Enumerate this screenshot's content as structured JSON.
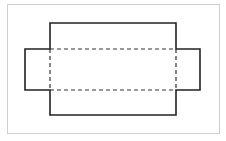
{
  "diagram": {
    "type": "net",
    "colors": {
      "frame": "#cfcfcf",
      "outline": "#222222",
      "fold": "#333333",
      "background": "#ffffff"
    },
    "outline_points": [
      [
        50,
        23
      ],
      [
        176,
        23
      ],
      [
        176,
        49
      ],
      [
        200,
        49
      ],
      [
        200,
        90
      ],
      [
        176,
        90
      ],
      [
        176,
        115
      ],
      [
        50,
        115
      ],
      [
        50,
        90
      ],
      [
        25,
        90
      ],
      [
        25,
        49
      ],
      [
        50,
        49
      ]
    ],
    "fold_lines": [
      {
        "x1": 50,
        "y1": 49,
        "x2": 176,
        "y2": 49
      },
      {
        "x1": 50,
        "y1": 90,
        "x2": 176,
        "y2": 90
      },
      {
        "x1": 50,
        "y1": 49,
        "x2": 50,
        "y2": 90
      },
      {
        "x1": 176,
        "y1": 49,
        "x2": 176,
        "y2": 90
      }
    ]
  }
}
